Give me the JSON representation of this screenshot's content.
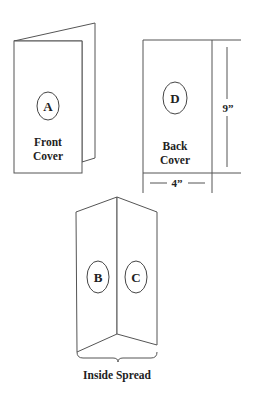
{
  "diagram": {
    "front": {
      "letter": "A",
      "caption_line1": "Front",
      "caption_line2": "Cover"
    },
    "back": {
      "letter": "D",
      "caption_line1": "Back",
      "caption_line2": "Cover",
      "width_label": "4”",
      "height_label": "9”"
    },
    "inside": {
      "left_letter": "B",
      "right_letter": "C",
      "caption": "Inside Spread"
    }
  }
}
